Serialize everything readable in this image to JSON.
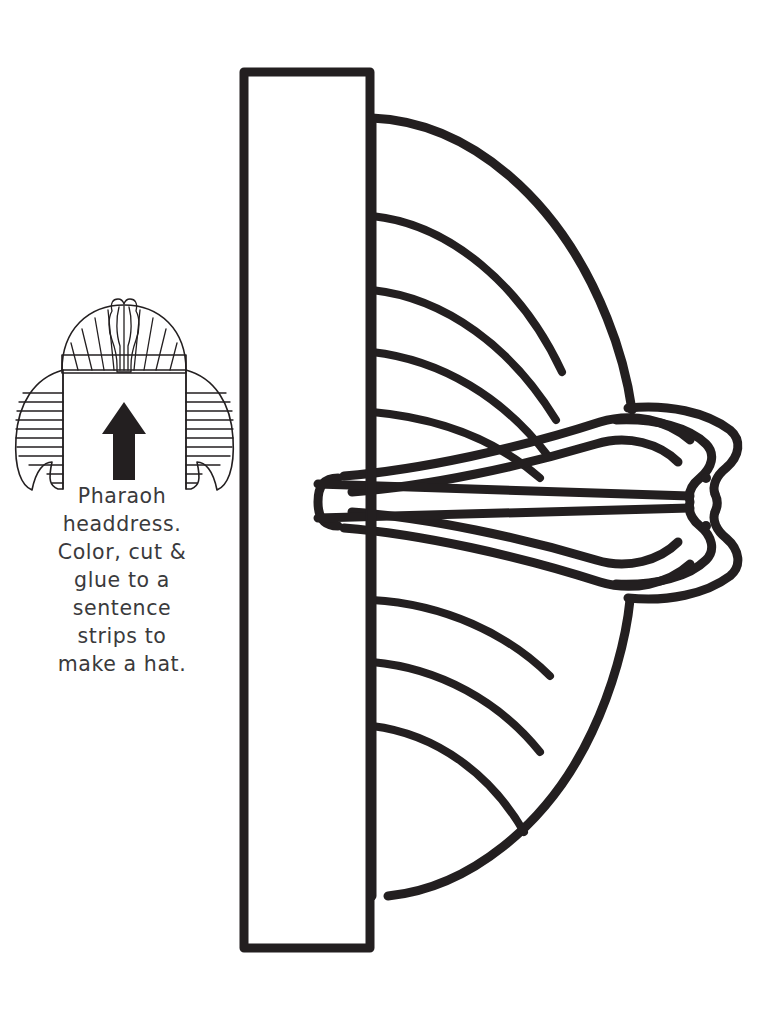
{
  "page": {
    "background_color": "#ffffff",
    "ink_color": "#231f20",
    "width": 777,
    "height": 1018
  },
  "caption": {
    "lines": [
      "Pharaoh",
      "headdress.",
      "Color, cut &",
      "glue to a",
      "sentence",
      "strips to",
      "make a hat."
    ],
    "full_text": "Pharaoh headdress. Color, cut & glue to a sentence strips to make a hat.",
    "text_color": "#3a3a3c"
  },
  "thumbnail": {
    "label": "assembled-headdress-example",
    "arrow_direction": "up",
    "arrow_color": "#000000",
    "parts": [
      "cobra-uraeus",
      "striped-dome",
      "headband",
      "left-lappet",
      "right-lappet"
    ]
  },
  "template": {
    "fold_strip_label": "sentence-strip-slot",
    "half_pattern_label": "headdress-half-pattern",
    "cobra_label": "uraeus-cobra-head",
    "eye_count": 2,
    "upper_stripe_count": 4,
    "lower_stripe_count": 3,
    "cobra_band_count": 4
  }
}
